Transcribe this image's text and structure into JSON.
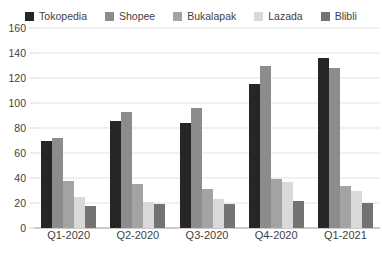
{
  "chart_data": {
    "type": "bar",
    "title": "",
    "xlabel": "",
    "ylabel": "",
    "ylim": [
      0,
      160
    ],
    "ytick_step": 20,
    "yticks": [
      160,
      140,
      120,
      100,
      80,
      60,
      40,
      20,
      0
    ],
    "grid": true,
    "legend_position": "top-center",
    "categories": [
      "Q1-2020",
      "Q2-2020",
      "Q3-2020",
      "Q4-2020",
      "Q1-2021"
    ],
    "series": [
      {
        "name": "Tokopedia",
        "color": "#262626",
        "values": [
          70,
          86,
          84,
          115,
          136
        ]
      },
      {
        "name": "Shopee",
        "color": "#8c8c8c",
        "values": [
          72,
          93,
          96,
          130,
          128
        ]
      },
      {
        "name": "Bukalapak",
        "color": "#a3a3a3",
        "values": [
          38,
          35,
          31,
          39,
          34
        ]
      },
      {
        "name": "Lazada",
        "color": "#d9d9d9",
        "values": [
          25,
          21,
          23,
          37,
          30
        ]
      },
      {
        "name": "Blibli",
        "color": "#737373",
        "values": [
          18,
          19,
          19,
          22,
          20
        ]
      }
    ]
  },
  "colors": {
    "gridline": "#e2e2e2",
    "axis": "#9a9a9a",
    "text": "#3f3f3f",
    "background": "#ffffff"
  }
}
